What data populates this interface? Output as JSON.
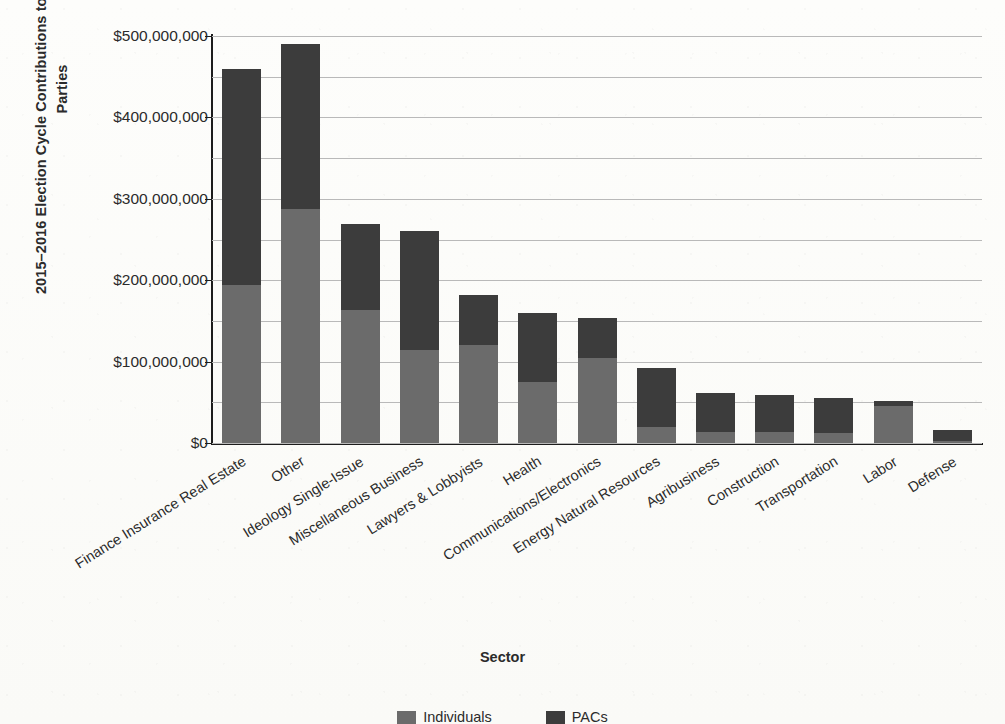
{
  "chart_data": {
    "type": "bar",
    "title": "",
    "xlabel": "Sector",
    "ylabel": "2015–2016 Election Cycle Contributions to Candidates and Parties",
    "ylim": [
      0,
      500000000
    ],
    "grid": true,
    "stacked": true,
    "gridline_interval": 50000000,
    "legend_position": "bottom",
    "categories": [
      "Finance Insurance Real Estate",
      "Other",
      "Ideology Single-Issue",
      "Miscellaneous Business",
      "Lawyers & Lobbyists",
      "Health",
      "Communications/Electronics",
      "Energy Natural Resources",
      "Agribusiness",
      "Construction",
      "Transportation",
      "Labor",
      "Defense"
    ],
    "series": [
      {
        "name": "Individuals",
        "color": "#6b6b6b",
        "values": [
          194000000,
          287000000,
          163000000,
          114000000,
          120000000,
          75000000,
          104000000,
          20000000,
          13000000,
          13000000,
          12000000,
          46000000,
          3000000
        ]
      },
      {
        "name": "PACs",
        "color": "#3c3c3c",
        "values": [
          266000000,
          203000000,
          106000000,
          147000000,
          62000000,
          85000000,
          50000000,
          72000000,
          48000000,
          46000000,
          43000000,
          6000000,
          13000000
        ]
      }
    ],
    "totals": [
      460000000,
      490000000,
      269000000,
      261000000,
      182000000,
      160000000,
      154000000,
      92000000,
      61000000,
      59000000,
      55000000,
      52000000,
      16000000
    ],
    "ytick_labels": [
      "$500,000,000",
      "$400,000,000",
      "$300,000,000",
      "$200,000,000",
      "$100,000,000",
      "$0"
    ],
    "ytick_values": [
      500000000,
      400000000,
      300000000,
      200000000,
      100000000,
      0
    ]
  },
  "axis": {
    "y_title": "2015–2016 Election Cycle Contributions to Candidates and Parties",
    "x_title": "Sector"
  },
  "legend": {
    "items": [
      {
        "label": "Individuals",
        "color": "#6b6b6b"
      },
      {
        "label": "PACs",
        "color": "#3c3c3c"
      }
    ]
  },
  "colors": {
    "segment_lower": "#6b6b6b",
    "segment_upper": "#3c3c3c",
    "gridline": "#b9b9b9",
    "axis": "#1d1d1d",
    "text": "#2b2b2b",
    "background": "#fdfdfb"
  }
}
